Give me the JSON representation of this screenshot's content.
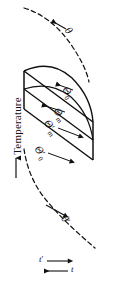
{
  "figure": {
    "domain_type": "diagram",
    "background_color": "#ffffff",
    "stroke_color": "#111111",
    "width": 118,
    "height": 283
  },
  "axes": {
    "y_axis_label": "Temperature",
    "y_axis_arrow": "up",
    "x_axis_labels": [
      {
        "id": "t-prime",
        "text": "t",
        "prime": "′",
        "arrow": "right"
      },
      {
        "id": "t",
        "text": "t",
        "prime": "",
        "arrow": "left"
      }
    ]
  },
  "curve_labels": {
    "theta_top": {
      "symbol": "θ",
      "subscript": "",
      "prime": "",
      "arrow": "left"
    },
    "theta_0": {
      "symbol": "Θ",
      "subscript": "0",
      "prime": "",
      "arrow": "left"
    },
    "theta_m": {
      "symbol": "Θ",
      "subscript": "m",
      "prime": "",
      "arrow": "left"
    },
    "theta_m_prime": {
      "symbol": "Θ",
      "subscript": "m",
      "prime": "′",
      "arrow": "right"
    },
    "theta_0_prime": {
      "symbol": "Θ",
      "subscript": "0",
      "prime": "′",
      "arrow": "right"
    },
    "theta_bottom_prime": {
      "symbol": "θ",
      "subscript": "",
      "prime": "′",
      "arrow": "right"
    }
  },
  "elements": {
    "upper_dashed_curve": "dashed",
    "lower_dashed_curve": "dashed",
    "body_outline": "solid parallelogram with curved right edge",
    "inner_lines": "three solid interior profile lines"
  }
}
